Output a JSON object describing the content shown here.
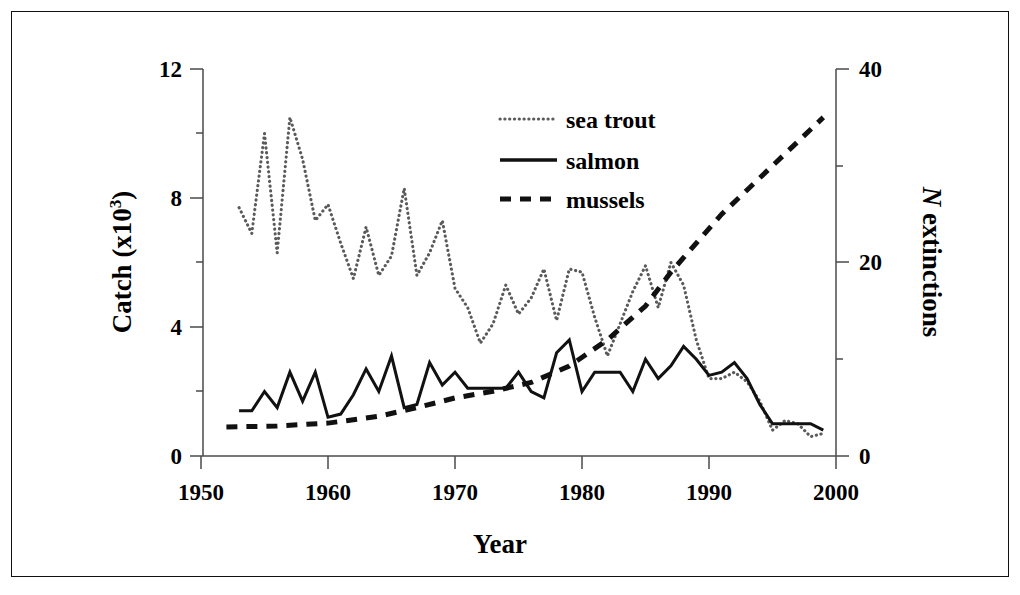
{
  "chart_data": {
    "type": "line",
    "title": "",
    "xlabel": "Year",
    "ylabel": "Catch (x10",
    "ylabel_sup": "3",
    "ylabel_close": ")",
    "y2label_italic": "N",
    "y2label": " extinctions",
    "xlim": [
      1950,
      2000
    ],
    "ylim": [
      0,
      12
    ],
    "y2lim": [
      0,
      40
    ],
    "grid": false,
    "legend_position": "upper-center",
    "xticks": [
      1950,
      1960,
      1970,
      1980,
      1990,
      2000
    ],
    "xtick_labels": [
      "1950",
      "1960",
      "1970",
      "1980",
      "1990",
      "2000"
    ],
    "yticks": [
      0,
      4,
      8,
      12
    ],
    "ytick_labels": [
      "0",
      "4",
      "8",
      "12"
    ],
    "yminorticks": [
      2,
      6,
      10
    ],
    "y2ticks": [
      0,
      20,
      40
    ],
    "y2tick_labels": [
      "0",
      "20",
      "40"
    ],
    "y2minorticks": [
      10,
      30
    ],
    "legend": [
      {
        "name": "sea trout",
        "style": "dotted"
      },
      {
        "name": "salmon",
        "style": "solid"
      },
      {
        "name": "mussels",
        "style": "dashed"
      }
    ],
    "series": [
      {
        "name": "sea trout",
        "axis": "left",
        "style": "dotted",
        "x": [
          1953,
          1954,
          1955,
          1956,
          1957,
          1958,
          1959,
          1960,
          1961,
          1962,
          1963,
          1964,
          1965,
          1966,
          1967,
          1968,
          1969,
          1970,
          1971,
          1972,
          1973,
          1974,
          1975,
          1976,
          1977,
          1978,
          1979,
          1980,
          1981,
          1982,
          1983,
          1984,
          1985,
          1986,
          1987,
          1988,
          1989,
          1990,
          1991,
          1992,
          1993,
          1994,
          1995,
          1996,
          1997,
          1998,
          1999
        ],
        "y": [
          7.7,
          6.9,
          10.0,
          6.3,
          10.5,
          9.2,
          7.3,
          7.8,
          6.6,
          5.5,
          7.1,
          5.6,
          6.2,
          8.3,
          5.6,
          6.3,
          7.3,
          5.2,
          4.6,
          3.5,
          4.1,
          5.3,
          4.4,
          4.9,
          5.8,
          4.2,
          5.8,
          5.7,
          4.3,
          3.1,
          4.1,
          5.1,
          5.9,
          4.6,
          6.0,
          5.3,
          3.6,
          2.4,
          2.4,
          2.6,
          2.3,
          1.7,
          0.8,
          1.1,
          1.0,
          0.6,
          0.7
        ]
      },
      {
        "name": "salmon",
        "axis": "left",
        "style": "solid",
        "x": [
          1953,
          1954,
          1955,
          1956,
          1957,
          1958,
          1959,
          1960,
          1961,
          1962,
          1963,
          1964,
          1965,
          1966,
          1967,
          1968,
          1969,
          1970,
          1971,
          1972,
          1973,
          1974,
          1975,
          1976,
          1977,
          1978,
          1979,
          1980,
          1981,
          1982,
          1983,
          1984,
          1985,
          1986,
          1987,
          1988,
          1989,
          1990,
          1991,
          1992,
          1993,
          1994,
          1995,
          1996,
          1997,
          1998,
          1999
        ],
        "y": [
          1.4,
          1.4,
          2.0,
          1.5,
          2.6,
          1.7,
          2.6,
          1.2,
          1.3,
          1.9,
          2.7,
          2.0,
          3.1,
          1.5,
          1.6,
          2.9,
          2.2,
          2.6,
          2.1,
          2.1,
          2.1,
          2.1,
          2.6,
          2.0,
          1.8,
          3.2,
          3.6,
          2.0,
          2.6,
          2.6,
          2.6,
          2.0,
          3.0,
          2.4,
          2.8,
          3.4,
          3.0,
          2.5,
          2.6,
          2.9,
          2.4,
          1.6,
          1.0,
          1.0,
          1.0,
          1.0,
          0.8
        ]
      },
      {
        "name": "mussels",
        "axis": "right",
        "style": "dashed",
        "x": [
          1952,
          1956,
          1960,
          1964,
          1967,
          1970,
          1973,
          1976,
          1979,
          1982,
          1985,
          1987,
          1989,
          1991,
          1993,
          1995,
          1997,
          1999
        ],
        "y": [
          3.0,
          3.1,
          3.4,
          4.1,
          5.0,
          6.0,
          6.7,
          7.6,
          9.3,
          12.0,
          15.5,
          19.0,
          22.0,
          25.0,
          27.5,
          30.0,
          32.5,
          35.0
        ]
      }
    ]
  },
  "axis": {
    "x_title": "Year",
    "y_left_title_main": "Catch (x10",
    "y_left_title_sup": "3",
    "y_left_title_end": ")",
    "y_right_title_italic": "N",
    "y_right_title_rest": " extinctions"
  },
  "colors": {
    "line_dark": "#111111",
    "line_gray": "#5a5a5a",
    "axis": "#4a4a4a",
    "frame": "#111111",
    "background": "#ffffff"
  }
}
